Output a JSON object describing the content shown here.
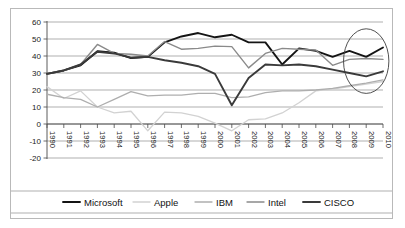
{
  "chart_data": {
    "type": "line",
    "title": "",
    "xlabel": "",
    "ylabel": "",
    "ylim": [
      -20,
      60
    ],
    "ytick_labels": [
      "60",
      "50",
      "40",
      "30",
      "20",
      "10",
      "0",
      "-10",
      "-20"
    ],
    "yticks": [
      60,
      50,
      40,
      30,
      20,
      10,
      0,
      -10,
      -20
    ],
    "grid": true,
    "legend_position": "bottom",
    "categories": [
      "1990",
      "1991",
      "1992",
      "1993",
      "1994",
      "1995",
      "1996",
      "1997",
      "1998",
      "1999",
      "2000",
      "2001",
      "2002",
      "2003",
      "2004",
      "2005",
      "2006",
      "2007",
      "2008",
      "2009",
      "2010"
    ],
    "series": [
      {
        "name": "Microsoft",
        "color": "#141414",
        "width": 1.9,
        "values": [
          29.5,
          31.5,
          34.5,
          42.8,
          42.0,
          38.8,
          39.5,
          48.0,
          51.5,
          53.5,
          51.0,
          52.5,
          48.0,
          48.0,
          35.0,
          44.5,
          43.0,
          39.5,
          43.0,
          39.5,
          45.0
        ]
      },
      {
        "name": "Apple",
        "color": "#d2d2d2",
        "width": 1.3,
        "values": [
          22.0,
          15.0,
          19.5,
          10.0,
          6.5,
          7.5,
          -4.0,
          7.0,
          6.5,
          4.5,
          0.5,
          -4.0,
          2.5,
          3.0,
          6.5,
          12.5,
          19.5,
          20.5,
          22.0,
          23.5,
          25.0
        ]
      },
      {
        "name": "IBM",
        "color": "#aeaeae",
        "width": 1.3,
        "values": [
          17.5,
          15.5,
          14.5,
          10.0,
          14.5,
          19.0,
          16.5,
          17.0,
          17.0,
          18.0,
          18.0,
          15.5,
          16.0,
          18.5,
          19.5,
          19.5,
          20.0,
          21.0,
          22.5,
          24.0,
          26.0
        ]
      },
      {
        "name": "Intel",
        "color": "#8a8a8a",
        "width": 1.4,
        "values": [
          29.5,
          31.5,
          35.0,
          46.8,
          41.5,
          41.0,
          40.0,
          48.5,
          44.0,
          44.5,
          45.8,
          45.5,
          33.0,
          41.5,
          44.5,
          44.0,
          43.5,
          34.5,
          38.0,
          38.5,
          38.0
        ]
      },
      {
        "name": "CISCO",
        "color": "#3a3a3a",
        "width": 1.9,
        "values": [
          29.5,
          31.5,
          35.0,
          42.5,
          41.5,
          39.0,
          39.5,
          37.5,
          36.0,
          34.0,
          29.5,
          11.0,
          27.0,
          35.0,
          34.5,
          35.0,
          34.0,
          32.0,
          30.0,
          28.0,
          31.0
        ]
      }
    ],
    "annotations": [
      {
        "type": "ellipse",
        "name": "highlight-ellipse",
        "note": "oval highlighting 2008-2010 region",
        "cx_year": 2009,
        "cy_value": 37,
        "rx_years": 1.35,
        "ry_value": 19
      }
    ]
  },
  "legend": {
    "items": [
      {
        "label": "Microsoft"
      },
      {
        "label": "Apple"
      },
      {
        "label": "IBM"
      },
      {
        "label": "Intel"
      },
      {
        "label": "CISCO"
      }
    ]
  }
}
